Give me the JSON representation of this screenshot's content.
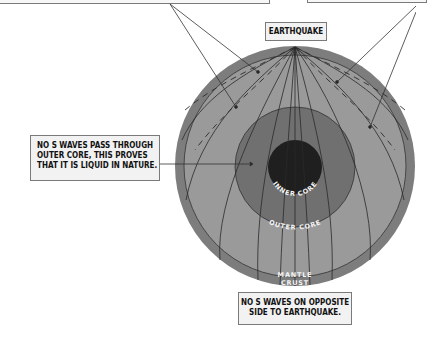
{
  "labels": {
    "earthquake": "EARTHQUAKE",
    "liquid_note": [
      "NO S WAVES PASS THROUGH",
      "OUTER CORE, THIS PROVES",
      "THAT IT IS LIQUID IN NATURE."
    ],
    "opposite_note": [
      "NO S WAVES ON OPPOSITE",
      "SIDE TO EARTHQUAKE."
    ]
  },
  "layers": {
    "inner_core": "INNER CORE",
    "outer_core": "OUTER CORE",
    "mantle": "MANTLE",
    "crust": "CRUST"
  },
  "colors": {
    "crust": "#7d7d7d",
    "mantle": "#9a9a9a",
    "outer_core": "#6e6e6e",
    "inner_core": "#1f1f1f",
    "lines": "#2a2a2a",
    "box_bg": "#f2f2f2"
  }
}
